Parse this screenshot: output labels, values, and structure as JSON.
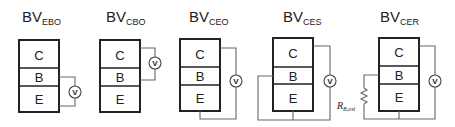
{
  "diagram": {
    "configurations": [
      {
        "id": "ebo",
        "title_main": "BV",
        "title_sub": "EBO",
        "regions": [
          "C",
          "B",
          "E"
        ],
        "meter_label": "V",
        "meter_between": [
          "B",
          "E"
        ]
      },
      {
        "id": "cbo",
        "title_main": "BV",
        "title_sub": "CBO",
        "regions": [
          "C",
          "B",
          "E"
        ],
        "meter_label": "V",
        "meter_between": [
          "C",
          "B"
        ]
      },
      {
        "id": "ceo",
        "title_main": "BV",
        "title_sub": "CEO",
        "regions": [
          "C",
          "B",
          "E"
        ],
        "meter_label": "V",
        "meter_between": [
          "C",
          "E"
        ]
      },
      {
        "id": "ces",
        "title_main": "BV",
        "title_sub": "CES",
        "regions": [
          "C",
          "B",
          "E"
        ],
        "meter_label": "V",
        "meter_between": [
          "C",
          "E"
        ],
        "base_shorted_to_emitter": true
      },
      {
        "id": "cer",
        "title_main": "BV",
        "title_sub": "CER",
        "regions": [
          "C",
          "B",
          "E"
        ],
        "meter_label": "V",
        "meter_between": [
          "C",
          "E"
        ],
        "base_resistor": {
          "label_main": "R",
          "label_sub": "B,ext"
        }
      }
    ],
    "colors": {
      "box_stroke": "#222222",
      "wire_stroke": "#666666",
      "background": "#ffffff"
    }
  }
}
